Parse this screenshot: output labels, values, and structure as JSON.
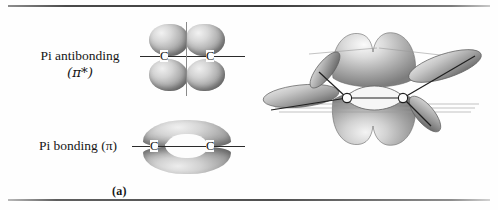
{
  "figure": {
    "background_color": "#fefefe",
    "rule_color": "#4a4a4a",
    "orbital_shading_color": "#b3b3b3"
  },
  "panel_a": {
    "caption": "(a)",
    "labels": {
      "antibonding_line1": "Pi antibonding",
      "antibonding_line2": "(π*)",
      "bonding": "Pi bonding (π)"
    },
    "atoms": {
      "carbon_left": "C",
      "carbon_right": "C"
    },
    "orbital_counts": {
      "antibonding_lobes": 4,
      "bonding_lobes": 2
    },
    "nodal_plane_present": true
  },
  "panel_b": {
    "caption": "(b)",
    "atoms": {
      "hydrogen_top_left": "H",
      "hydrogen_top_right": "H",
      "hydrogen_bottom_left": "H",
      "hydrogen_bottom_right": "H"
    },
    "orbital_labels": {
      "pi_top": "π",
      "pi_bottom": "π",
      "sp2_center": "sp",
      "sp2_center_exp": "2",
      "sp2_top_left": "sp",
      "sp2_top_left_exp": "2",
      "sp2_bottom_left": "sp",
      "sp2_bottom_left_exp": "2",
      "sp2_top_right": "sp",
      "sp2_top_right_exp": "2",
      "sp2_bottom_right": "sp",
      "sp2_bottom_right_exp": "2"
    }
  }
}
